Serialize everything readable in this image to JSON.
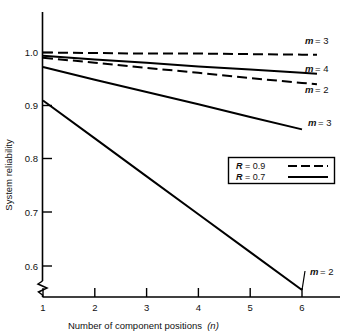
{
  "chart_data": {
    "type": "line",
    "title": "",
    "xlabel": "Number of component positions (n)",
    "ylabel": "System reliability",
    "x": [
      1,
      2,
      3,
      4,
      5,
      6
    ],
    "xlim": [
      1,
      6
    ],
    "ylim": [
      0.55,
      1.01
    ],
    "xticks": [
      "1",
      "2",
      "3",
      "4",
      "5",
      "6"
    ],
    "yticks": [
      "0.6",
      "0.7",
      "0.8",
      "0.9",
      "1.0"
    ],
    "grid": false,
    "axis_break": "y-axis broken below 0.6",
    "legend_position": "middle-right",
    "series": [
      {
        "name": "R = 0.9, m = 3",
        "label": "m = 3",
        "R": 0.9,
        "m": 3,
        "style": "dashed",
        "values": [
          1.0,
          0.999,
          0.998,
          0.998,
          0.997,
          0.996
        ]
      },
      {
        "name": "R = 0.7, m = 4",
        "label": "m = 4",
        "R": 0.7,
        "m": 4,
        "style": "solid",
        "values": [
          0.994,
          0.987,
          0.981,
          0.974,
          0.968,
          0.962
        ]
      },
      {
        "name": "R = 0.9, m = 2",
        "label": "m = 2",
        "R": 0.9,
        "m": 2,
        "style": "dashed",
        "values": [
          0.99,
          0.981,
          0.971,
          0.962,
          0.952,
          0.943
        ]
      },
      {
        "name": "R = 0.7, m = 3",
        "label": "m = 3",
        "R": 0.7,
        "m": 3,
        "style": "solid",
        "values": [
          0.973,
          0.949,
          0.926,
          0.903,
          0.879,
          0.856
        ]
      },
      {
        "name": "R = 0.7, m = 2",
        "label": "m = 2",
        "R": 0.7,
        "m": 2,
        "style": "solid",
        "values": [
          0.91,
          0.839,
          0.768,
          0.697,
          0.626,
          0.555
        ]
      }
    ],
    "legend": [
      {
        "text": "R = 0.9",
        "symbol": "R",
        "value": "= 0.9",
        "style": "dashed"
      },
      {
        "text": "R = 0.7",
        "symbol": "R",
        "value": "= 0.7",
        "style": "solid"
      }
    ],
    "annotations": [
      {
        "label": "m = 3",
        "symbol": "m",
        "value": "= 3",
        "series": "R = 0.9, m = 3"
      },
      {
        "label": "m = 4",
        "symbol": "m",
        "value": "= 4",
        "series": "R = 0.7, m = 4"
      },
      {
        "label": "m = 2",
        "symbol": "m",
        "value": "= 2",
        "series": "R = 0.9, m = 2"
      },
      {
        "label": "m = 3",
        "symbol": "m",
        "value": "= 3",
        "series": "R = 0.7, m = 3"
      },
      {
        "label": "m = 2",
        "symbol": "m",
        "value": "= 2",
        "series": "R = 0.7, m = 2"
      }
    ],
    "xlabel_parts": {
      "text": "Number of component positions",
      "variable": "(n)"
    },
    "colors": {
      "line": "#000000",
      "axis": "#000000",
      "background": "#ffffff"
    }
  }
}
